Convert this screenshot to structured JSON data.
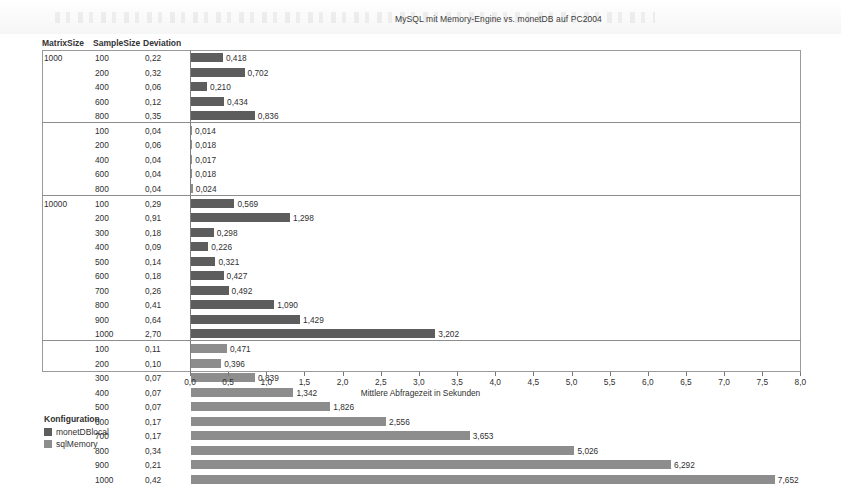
{
  "title": "MySQL mit Memory-Engine vs. monetDB auf PC2004",
  "columns": {
    "matrix": "MatrixSize",
    "sample": "SampleSize",
    "deviation": "Deviation"
  },
  "legend": {
    "title": "Konfiguration",
    "items": [
      {
        "label": "monetDBlocal",
        "color": "#5d5d5d"
      },
      {
        "label": "sqlMemory",
        "color": "#8d8d8d"
      }
    ]
  },
  "chart_data": {
    "type": "bar",
    "title": "MySQL mit Memory-Engine vs. monetDB auf PC2004",
    "xlabel": "Mittlere Abfragezeit in Sekunden",
    "ylabel": "",
    "xlim": [
      0,
      8
    ],
    "xticks": [
      "0,0",
      "0,5",
      "1,0",
      "1,5",
      "2,0",
      "2,5",
      "3,0",
      "3,5",
      "4,0",
      "4,5",
      "5,0",
      "5,5",
      "6,0",
      "6,5",
      "7,0",
      "7,5",
      "8,0"
    ],
    "xtick_values": [
      0,
      0.5,
      1,
      1.5,
      2,
      2.5,
      3,
      3.5,
      4,
      4.5,
      5,
      5.5,
      6,
      6.5,
      7,
      7.5,
      8
    ],
    "grid": false,
    "legend_position": "below-left",
    "groups": [
      {
        "matrix_size": "1000",
        "config": "monetDBlocal",
        "series_color": "#5d5d5d",
        "rows": [
          {
            "sample": "100",
            "deviation": "0,22",
            "value": 0.418,
            "label": "0,418"
          },
          {
            "sample": "200",
            "deviation": "0,32",
            "value": 0.702,
            "label": "0,702"
          },
          {
            "sample": "400",
            "deviation": "0,06",
            "value": 0.21,
            "label": "0,210"
          },
          {
            "sample": "600",
            "deviation": "0,12",
            "value": 0.434,
            "label": "0,434"
          },
          {
            "sample": "800",
            "deviation": "0,35",
            "value": 0.836,
            "label": "0,836"
          }
        ]
      },
      {
        "matrix_size": "",
        "config": "sqlMemory",
        "series_color": "#8d8d8d",
        "rows": [
          {
            "sample": "100",
            "deviation": "0,04",
            "value": 0.014,
            "label": "0,014"
          },
          {
            "sample": "200",
            "deviation": "0,06",
            "value": 0.018,
            "label": "0,018"
          },
          {
            "sample": "400",
            "deviation": "0,04",
            "value": 0.017,
            "label": "0,017"
          },
          {
            "sample": "600",
            "deviation": "0,04",
            "value": 0.018,
            "label": "0,018"
          },
          {
            "sample": "800",
            "deviation": "0,04",
            "value": 0.024,
            "label": "0,024"
          }
        ]
      },
      {
        "matrix_size": "10000",
        "config": "monetDBlocal",
        "series_color": "#5d5d5d",
        "rows": [
          {
            "sample": "100",
            "deviation": "0,29",
            "value": 0.569,
            "label": "0,569"
          },
          {
            "sample": "200",
            "deviation": "0,91",
            "value": 1.298,
            "label": "1,298"
          },
          {
            "sample": "300",
            "deviation": "0,18",
            "value": 0.298,
            "label": "0,298"
          },
          {
            "sample": "400",
            "deviation": "0,09",
            "value": 0.226,
            "label": "0,226"
          },
          {
            "sample": "500",
            "deviation": "0,14",
            "value": 0.321,
            "label": "0,321"
          },
          {
            "sample": "600",
            "deviation": "0,18",
            "value": 0.427,
            "label": "0,427"
          },
          {
            "sample": "700",
            "deviation": "0,26",
            "value": 0.492,
            "label": "0,492"
          },
          {
            "sample": "800",
            "deviation": "0,41",
            "value": 1.09,
            "label": "1,090"
          },
          {
            "sample": "900",
            "deviation": "0,64",
            "value": 1.429,
            "label": "1,429"
          },
          {
            "sample": "1000",
            "deviation": "2,70",
            "value": 3.202,
            "label": "3,202"
          }
        ]
      },
      {
        "matrix_size": "",
        "config": "sqlMemory",
        "series_color": "#8d8d8d",
        "rows": [
          {
            "sample": "100",
            "deviation": "0,11",
            "value": 0.471,
            "label": "0,471"
          },
          {
            "sample": "200",
            "deviation": "0,10",
            "value": 0.396,
            "label": "0,396"
          },
          {
            "sample": "300",
            "deviation": "0,07",
            "value": 0.839,
            "label": "0,839"
          },
          {
            "sample": "400",
            "deviation": "0,07",
            "value": 1.342,
            "label": "1,342"
          },
          {
            "sample": "500",
            "deviation": "0,07",
            "value": 1.826,
            "label": "1,826"
          },
          {
            "sample": "600",
            "deviation": "0,17",
            "value": 2.556,
            "label": "2,556"
          },
          {
            "sample": "700",
            "deviation": "0,17",
            "value": 3.653,
            "label": "3,653"
          },
          {
            "sample": "800",
            "deviation": "0,34",
            "value": 5.026,
            "label": "5,026"
          },
          {
            "sample": "900",
            "deviation": "0,21",
            "value": 6.292,
            "label": "6,292"
          },
          {
            "sample": "1000",
            "deviation": "0,42",
            "value": 7.652,
            "label": "7,652"
          }
        ]
      }
    ]
  }
}
